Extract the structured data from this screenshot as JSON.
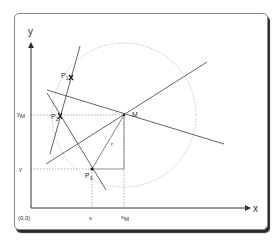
{
  "diagram": {
    "axes": {
      "x_label": "x",
      "y_label": "y",
      "origin_label": "(0,0)"
    },
    "points": [
      {
        "id": "P1",
        "label": "P",
        "subscript": "1"
      },
      {
        "id": "P2",
        "label": "P",
        "subscript": "2"
      },
      {
        "id": "P3",
        "label": "P",
        "subscript": "3"
      },
      {
        "id": "M",
        "label": "M",
        "subscript": ""
      }
    ],
    "tick_labels": {
      "xM": {
        "main": "x",
        "sub": "M"
      },
      "yM": {
        "main": "y",
        "sub": "M"
      },
      "x": "x",
      "y": "y"
    },
    "radius_label": "r",
    "colors": {
      "line": "#555555",
      "dotted": "#9a9a9a",
      "circle": "#bdbdbd",
      "text": "#333333"
    }
  }
}
